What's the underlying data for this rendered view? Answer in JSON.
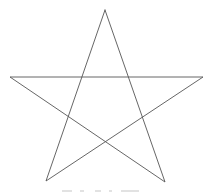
{
  "diagram": {
    "type": "pentagram",
    "stroke_color": "#555555",
    "background": "#ffffff",
    "vertices": {
      "top": [
        105,
        10
      ],
      "left": [
        10,
        77
      ],
      "right": [
        203,
        77
      ],
      "bottom_left": [
        46,
        181
      ],
      "bottom_right": [
        165,
        182
      ]
    },
    "path_order": [
      "top",
      "bottom_left",
      "right",
      "left",
      "bottom_right",
      "top"
    ]
  },
  "caption": {
    "visible": true,
    "legible": false
  }
}
